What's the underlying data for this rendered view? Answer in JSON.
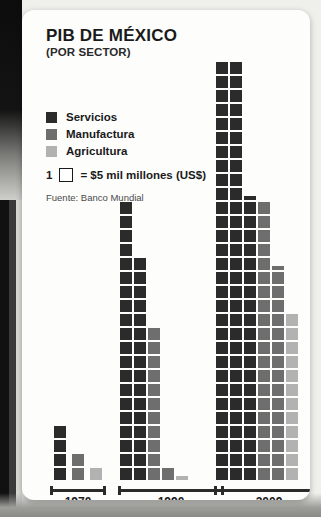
{
  "title": "PIB DE MÉXICO",
  "subtitle": "(POR SECTOR)",
  "legend": {
    "items": [
      {
        "label": "Servicios",
        "color": "#2b2b2b",
        "name": "servicios"
      },
      {
        "label": "Manufactura",
        "color": "#6e6e6e",
        "name": "manufactura"
      },
      {
        "label": "Agricultura",
        "color": "#b2b2b2",
        "name": "agricultura"
      }
    ],
    "unit_count": "1",
    "unit_text": "= $5 mil millones (US$)"
  },
  "source": "Fuente: Banco Mundial",
  "colors": {
    "servicios": "#2b2b2b",
    "manufactura": "#6e6e6e",
    "agricultura": "#b2b2b2",
    "axis": "#2b2b2b",
    "card": "#fdfdfc",
    "text": "#1a1a1a"
  },
  "chart_data": {
    "type": "bar",
    "title": "PIB DE MÉXICO (POR SECTOR)",
    "subtitle": "Pictograma: cada cuadro = $5 mil millones (US$)",
    "xlabel": "",
    "ylabel": "PIB (miles de millones US$)",
    "unit_value_usd_billions": 5,
    "categories": [
      "1970",
      "1990",
      "2009"
    ],
    "series": [
      {
        "name": "Servicios",
        "color": "#2b2b2b",
        "squares": [
          4,
          36,
          80.5
        ],
        "values_usd_billions": [
          20,
          180,
          402.5
        ]
      },
      {
        "name": "Manufactura",
        "color": "#6e6e6e",
        "squares": [
          2,
          12,
          35.5
        ],
        "values_usd_billions": [
          10,
          60,
          177.5
        ]
      },
      {
        "name": "Agricultura",
        "color": "#b2b2b2",
        "squares": [
          1,
          0.3,
          12
        ],
        "values_usd_billions": [
          5,
          1.5,
          60
        ]
      }
    ],
    "legend_position": "top-left",
    "grid": false
  },
  "layout": {
    "cell": 12,
    "pitch": 14,
    "baseline_y": 470,
    "groups": [
      {
        "year": "1970",
        "axis_x": 28,
        "axis_w": 56,
        "label_x": 28,
        "label_w": 56,
        "columns": [
          {
            "series": "servicios",
            "x": 32,
            "full": 4,
            "stub": 0
          },
          {
            "series": "manufactura",
            "x": 50,
            "full": 2,
            "stub": 0
          },
          {
            "series": "agricultura",
            "x": 68,
            "full": 1,
            "stub": 0
          }
        ]
      },
      {
        "year": "1990",
        "axis_x": 96,
        "axis_w": 106,
        "label_x": 96,
        "label_w": 106,
        "columns": [
          {
            "series": "servicios",
            "x": 98,
            "full": 20,
            "stub": 0
          },
          {
            "series": "servicios",
            "x": 112,
            "full": 16,
            "stub": 0
          },
          {
            "series": "manufactura",
            "x": 126,
            "full": 11,
            "stub": 0
          },
          {
            "series": "manufactura",
            "x": 140,
            "full": 1,
            "stub": 0
          },
          {
            "series": "agricultura",
            "x": 154,
            "full": 0,
            "stub": 1
          }
        ]
      },
      {
        "year": "2009",
        "axis_x": 192,
        "axis_w": 110,
        "label_x": 192,
        "label_w": 110,
        "columns": [
          {
            "series": "servicios",
            "x": 194,
            "full": 30,
            "stub": 0
          },
          {
            "series": "servicios",
            "x": 208,
            "full": 30,
            "stub": 0
          },
          {
            "series": "servicios",
            "x": 222,
            "full": 20,
            "stub": 1
          },
          {
            "series": "manufactura",
            "x": 236,
            "full": 20,
            "stub": 0
          },
          {
            "series": "manufactura",
            "x": 250,
            "full": 15,
            "stub": 1
          },
          {
            "series": "agricultura",
            "x": 264,
            "full": 12,
            "stub": 0
          }
        ]
      }
    ]
  }
}
